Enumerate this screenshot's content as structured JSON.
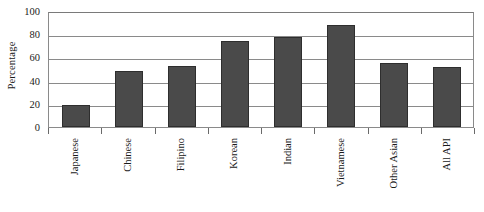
{
  "chart_data": {
    "type": "bar",
    "title": "",
    "subtitle": "",
    "xlabel": "",
    "ylabel": "Percentage",
    "ylim": [
      0,
      100
    ],
    "ytick_values": [
      100,
      80,
      60,
      40,
      20,
      0
    ],
    "ytick_labels": [
      "100",
      "80",
      "60",
      "40",
      "20",
      "0"
    ],
    "grid": true,
    "legend": false,
    "legend_position": "none",
    "categories": [
      "Japanese",
      "Chinese",
      "Filipino",
      "Korean",
      "Indian",
      "Vietnamese",
      "Other Asian",
      "All API"
    ],
    "values": [
      19,
      48,
      53,
      74,
      78,
      88,
      55,
      52
    ],
    "bar_color": "#4a4a4a",
    "bar_edge_color": "#2e2e2e",
    "gridline_color": "#8a8a8a",
    "axis_color": "#8a8a8a",
    "background_color": "#ffffff",
    "text_color": "#1a1a1a"
  }
}
